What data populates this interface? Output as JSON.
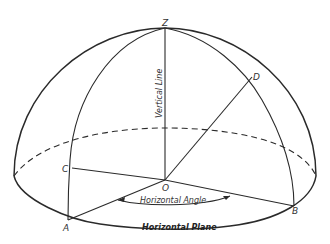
{
  "diagram": {
    "points": {
      "Z": "Z",
      "D": "D",
      "C": "C",
      "O": "O",
      "A": "A",
      "B": "B"
    },
    "labels": {
      "vertical_line": "Vertical Line",
      "horizontal_angle": "Horizontal Angle",
      "horizontal_plane": "Horizontal Plane"
    },
    "colors": {
      "line": "#2a2a2a",
      "background": "#ffffff"
    }
  }
}
